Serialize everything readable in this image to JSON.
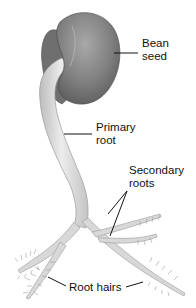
{
  "diagram": {
    "labels": {
      "bean_seed": [
        "Bean",
        "seed"
      ],
      "primary_root": [
        "Primary",
        "root"
      ],
      "secondary_roots": [
        "Secondary",
        "roots"
      ],
      "root_hairs": "Root hairs"
    },
    "colors": {
      "seed": "#7d7d7d",
      "seed_highlight": "#a9a9a9",
      "root": "#d6d6d6",
      "root_edge": "#9a9a9a",
      "leader_line": "#111111"
    }
  }
}
